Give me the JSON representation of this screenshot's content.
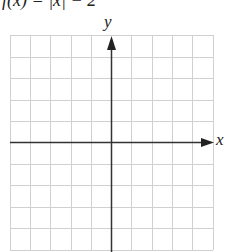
{
  "figure": {
    "title": "f(x) = |x| − 2",
    "x_axis_label": "x",
    "y_axis_label": "y",
    "grid": {
      "columns": 10,
      "rows": 10,
      "line_color": "#d0d0d0",
      "axis_color": "#333333"
    }
  }
}
